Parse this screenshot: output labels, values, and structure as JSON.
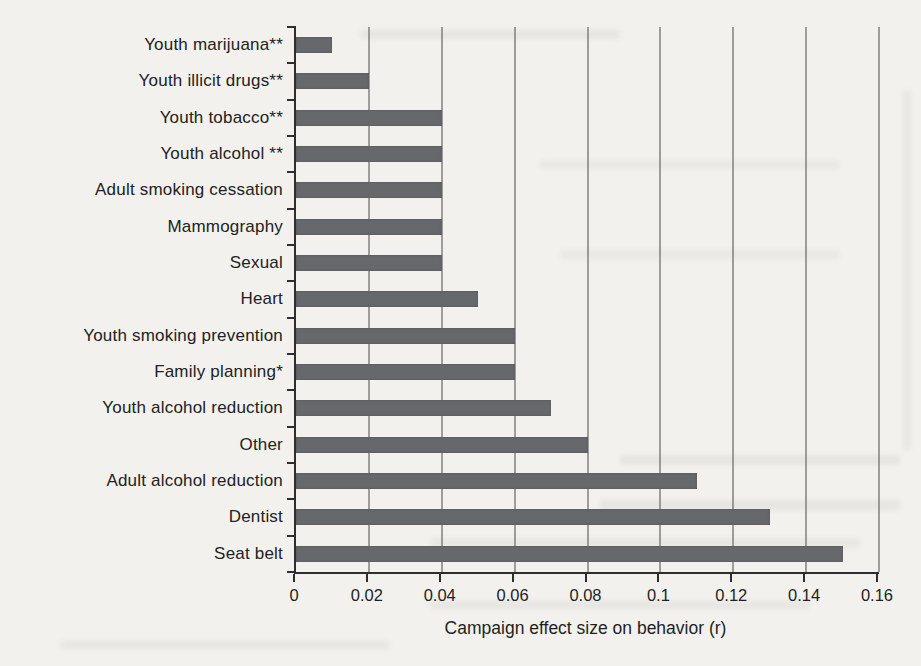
{
  "page": {
    "background_color": "#f2f1ed",
    "bar_color": "#67686b",
    "gridline_color": "#4a4a4a",
    "axis_color": "#2e2e2e"
  },
  "chart_data": {
    "type": "bar",
    "orientation": "horizontal",
    "title": "",
    "xlabel": "Campaign effect size on behavior (r)",
    "ylabel": "",
    "categories": [
      "Youth marijuana**",
      "Youth illicit drugs**",
      "Youth tobacco**",
      "Youth alcohol **",
      "Adult smoking cessation",
      "Mammography",
      "Sexual",
      "Heart",
      "Youth smoking prevention",
      "Family planning*",
      "Youth alcohol reduction",
      "Other",
      "Adult alcohol reduction",
      "Dentist",
      "Seat belt"
    ],
    "values": [
      0.01,
      0.02,
      0.04,
      0.04,
      0.04,
      0.04,
      0.04,
      0.05,
      0.06,
      0.06,
      0.07,
      0.08,
      0.11,
      0.13,
      0.15
    ],
    "xlim": [
      0,
      0.16
    ],
    "xticks": [
      "0",
      "0.02",
      "0.04",
      "0.06",
      "0.08",
      "0.1",
      "0.12",
      "0.14",
      "0.16"
    ],
    "xtick_interval": 0.02,
    "grid": "vertical-only",
    "legend": "none",
    "bar_color": "#67686b"
  }
}
